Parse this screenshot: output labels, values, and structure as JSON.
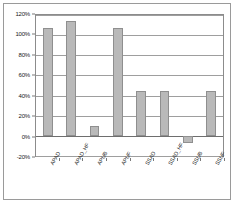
{
  "chart_data": {
    "type": "bar",
    "title": "",
    "subtitle": "",
    "xlabel": "",
    "ylabel": "",
    "categories": [
      "APAD",
      "APAD_HF",
      "APUB",
      "APUF",
      "SSAD",
      "SSAD_HF",
      "SSUB",
      "SSUF"
    ],
    "values": [
      107,
      114,
      10,
      107,
      45,
      45,
      -7,
      45
    ],
    "ylim": [
      -20,
      120
    ],
    "ytick_labels": [
      "120%",
      "100%",
      "80%",
      "60%",
      "40%",
      "20%",
      "0%",
      "-20%"
    ],
    "ytick_values": [
      120,
      100,
      80,
      60,
      40,
      20,
      0,
      -20
    ],
    "grid": true,
    "legend": false,
    "legend_position": "none",
    "bar_color": "#b9b9b9",
    "bar_border_color": "#8f8f8f",
    "gridline_color": "#9e9e9e",
    "plot_border_color": "#8c8c8c",
    "frame_border_color": "#9a9a9a",
    "background_color": "#ffffff",
    "axis_text_color": "#1a1a1a"
  }
}
